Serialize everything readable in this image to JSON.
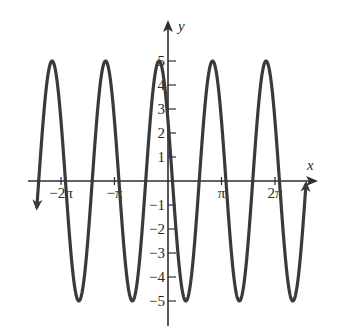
{
  "chart_data": {
    "type": "line",
    "title": "",
    "xlabel": "x",
    "ylabel": "y",
    "function": "y = 5cos(2x + π/3)",
    "amplitude": 5,
    "period": "π",
    "x_ticks": [
      {
        "value": -6.2832,
        "label": "−2π"
      },
      {
        "value": -3.1416,
        "label": "−π"
      },
      {
        "value": 3.1416,
        "label": "π"
      },
      {
        "value": 6.2832,
        "label": "2π"
      }
    ],
    "y_ticks": [
      {
        "value": 5,
        "label": "5"
      },
      {
        "value": 4,
        "label": "4"
      },
      {
        "value": 3,
        "label": "3"
      },
      {
        "value": 2,
        "label": "2"
      },
      {
        "value": 1,
        "label": "1"
      },
      {
        "value": -1,
        "label": "−1"
      },
      {
        "value": -2,
        "label": "−2"
      },
      {
        "value": -3,
        "label": "−3"
      },
      {
        "value": -4,
        "label": "−4"
      },
      {
        "value": -5,
        "label": "−5"
      }
    ],
    "xlim": [
      -7.7,
      8.3
    ],
    "ylim": [
      -5.9,
      6.6
    ],
    "curve_x_range": [
      -7.7,
      8.1
    ],
    "peaks_x": [
      -7.33,
      -4.19,
      -0.52,
      2.62,
      5.76
    ],
    "troughs_x": [
      -5.76,
      -2.62,
      1.05,
      4.19,
      7.33
    ],
    "ends": {
      "left": "arrow-down",
      "right": "arrow-up"
    },
    "grid": false,
    "colors": {
      "curve": "#3a3a3a",
      "axis": "#2e2e2e",
      "text": "#2b2b2b"
    }
  }
}
